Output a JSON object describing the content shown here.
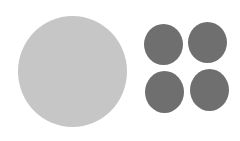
{
  "background": "#ffffff",
  "large_circle": {
    "label": "large circle",
    "color": "#c6c6c6",
    "left": 18,
    "top": 16,
    "width": 109,
    "height": 111
  },
  "small_circles": [
    {
      "label": "small circle top-left",
      "color": "#6f6f6f",
      "left": 144,
      "top": 24,
      "width": 39,
      "height": 41
    },
    {
      "label": "small circle top-right",
      "color": "#6f6f6f",
      "left": 188,
      "top": 22,
      "width": 39,
      "height": 41
    },
    {
      "label": "small circle bottom-left",
      "color": "#6f6f6f",
      "left": 145,
      "top": 71,
      "width": 39,
      "height": 42
    },
    {
      "label": "small circle bottom-right",
      "color": "#6f6f6f",
      "left": 190,
      "top": 69,
      "width": 39,
      "height": 42
    }
  ]
}
